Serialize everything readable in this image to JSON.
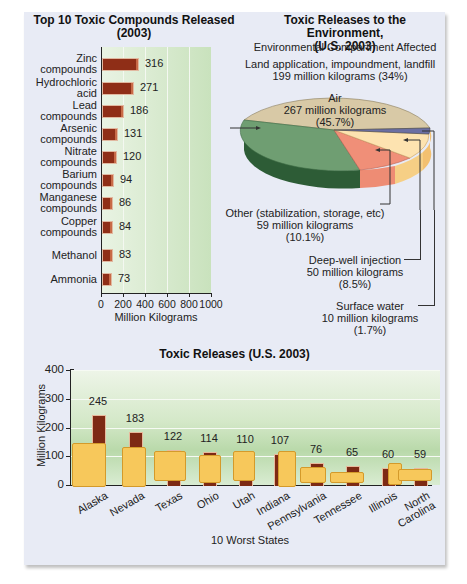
{
  "chart_data": [
    {
      "type": "bar",
      "orientation": "horizontal",
      "title": "Top 10 Toxic Compounds Released (2003)",
      "title_lines": [
        "Top 10 Toxic Compounds Released",
        "(2003)"
      ],
      "categories": [
        "Zinc compounds",
        "Hydrochloric acid",
        "Lead compounds",
        "Arsenic compounds",
        "Nitrate compounds",
        "Barium compounds",
        "Manganese compounds",
        "Copper compounds",
        "Methanol",
        "Ammonia"
      ],
      "category_lines": [
        [
          "Zinc",
          "compounds"
        ],
        [
          "Hydrochloric",
          "acid"
        ],
        [
          "Lead",
          "compounds"
        ],
        [
          "Arsenic",
          "compounds"
        ],
        [
          "Nitrate",
          "compounds"
        ],
        [
          "Barium",
          "compounds"
        ],
        [
          "Manganese",
          "compounds"
        ],
        [
          "Copper",
          "compounds"
        ],
        [
          "Methanol"
        ],
        [
          "Ammonia"
        ]
      ],
      "values": [
        316,
        271,
        186,
        131,
        120,
        94,
        86,
        84,
        83,
        73
      ],
      "value_labels": [
        "316",
        "271",
        "186",
        "131",
        "120",
        "94",
        "86",
        "84",
        "83",
        "73"
      ],
      "xlabel": "Million Kilograms",
      "xticks": [
        "0",
        "200",
        "400",
        "600",
        "800",
        "1000"
      ],
      "xlim": [
        0,
        1000
      ],
      "grid": true
    },
    {
      "type": "pie",
      "title": "Toxic Releases to the Environment, (U.S. 2003)",
      "title_lines": [
        "Toxic Releases to the Environment,",
        "(U.S. 2003)"
      ],
      "subtitle": "Environmental Compartment Affected",
      "slices": [
        {
          "name": "Air",
          "value": 267,
          "percent": 45.7,
          "label_lines": [
            "Air",
            "267 million kilograms",
            "(45.7%)"
          ],
          "color": "#d8c9a6"
        },
        {
          "name": "Land application, impoundment, landfill",
          "value": 199,
          "percent": 34,
          "label_lines": [
            "Land application, impoundment, landfill",
            "199 million kilograms (34%)"
          ],
          "color": "#6f9e72"
        },
        {
          "name": "Other (stabilization, storage, etc)",
          "value": 59,
          "percent": 10.1,
          "label_lines": [
            "Other (stabilization, storage, etc)",
            "59 million kilograms",
            "(10.1%)"
          ],
          "color": "#f08f78"
        },
        {
          "name": "Deep-well injection",
          "value": 50,
          "percent": 8.5,
          "label_lines": [
            "Deep-well injection",
            "50 million kilograms",
            "(8.5%)"
          ],
          "color": "#fde3b0"
        },
        {
          "name": "Surface water",
          "value": 10,
          "percent": 1.7,
          "label_lines": [
            "Surface water",
            "10 million kilograms",
            "(1.7%)"
          ],
          "color": "#6b6fa3"
        }
      ],
      "units": "million kilograms"
    },
    {
      "type": "bar",
      "orientation": "vertical",
      "title": "Toxic Releases (U.S. 2003)",
      "categories": [
        "Alaska",
        "Nevada",
        "Texas",
        "Ohio",
        "Utah",
        "Indiana",
        "Pennsylvania",
        "Tennessee",
        "Illinois",
        "North Carolina"
      ],
      "category_lines": [
        [
          "Alaska"
        ],
        [
          "Nevada"
        ],
        [
          "Texas"
        ],
        [
          "Ohio"
        ],
        [
          "Utah"
        ],
        [
          "Indiana"
        ],
        [
          "Pennsylvania"
        ],
        [
          "Tennessee"
        ],
        [
          "Illinois"
        ],
        [
          "North",
          "Carolina"
        ]
      ],
      "values": [
        245,
        183,
        122,
        114,
        110,
        107,
        76,
        65,
        60,
        59
      ],
      "value_labels": [
        "245",
        "183",
        "122",
        "114",
        "110",
        "107",
        "76",
        "65",
        "60",
        "59"
      ],
      "xlabel": "10 Worst States",
      "ylabel": "Million Kilograms",
      "yticks": [
        "0",
        "100",
        "200",
        "300",
        "400"
      ],
      "ylim": [
        0,
        400
      ],
      "grid": true
    }
  ],
  "colors": {
    "panel_bg": "#e8ebf5",
    "bar_fill": "#8f2e17",
    "bar_outline": "#e1b8a0",
    "state_fill": "#f7c85b",
    "plot_bg": "#c9e2bd"
  }
}
